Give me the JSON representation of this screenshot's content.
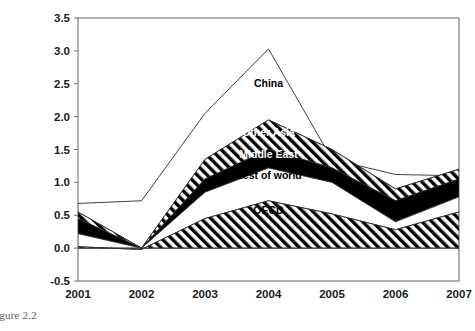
{
  "figure": {
    "caption": "igure 2.2",
    "full_caption_text": "Figure 2.2"
  },
  "chart_data": {
    "type": "area",
    "stacked": true,
    "title": "",
    "xlabel": "",
    "ylabel": "",
    "x": [
      2001,
      2002,
      2003,
      2004,
      2005,
      2006,
      2007
    ],
    "xtick_labels": [
      "2001",
      "2002",
      "2003",
      "2004",
      "2005",
      "2006",
      "2007"
    ],
    "ytick_labels": [
      "-0.5",
      "0.0",
      "0.5",
      "1.0",
      "1.5",
      "2.0",
      "2.5",
      "3.0",
      "3.5"
    ],
    "ytick_values": [
      -0.5,
      0.0,
      0.5,
      1.0,
      1.5,
      2.0,
      2.5,
      3.0,
      3.5
    ],
    "ylim": [
      -0.5,
      3.5
    ],
    "xlim": [
      2001,
      2007
    ],
    "grid": false,
    "legend_position": "inline-annotations",
    "series": [
      {
        "name": "OECD",
        "fill": "diagonal-hatch",
        "values": [
          0.02,
          -0.02,
          0.45,
          0.72,
          0.52,
          0.28,
          0.55
        ],
        "cumulative_top": [
          0.02,
          -0.02,
          0.45,
          0.72,
          0.52,
          0.28,
          0.55
        ]
      },
      {
        "name": "Rest of world",
        "fill": "white",
        "values": [
          0.2,
          0.02,
          0.4,
          0.5,
          0.48,
          0.12,
          0.23
        ],
        "cumulative_top": [
          0.22,
          0.0,
          0.85,
          1.22,
          1.0,
          0.4,
          0.78
        ]
      },
      {
        "name": "Middle East",
        "fill": "black",
        "values": [
          0.23,
          0.0,
          0.2,
          0.28,
          0.22,
          0.32,
          0.27
        ],
        "cumulative_top": [
          0.45,
          0.0,
          1.05,
          1.5,
          1.22,
          0.72,
          1.05
        ]
      },
      {
        "name": "Other Asia",
        "fill": "diagonal-hatch",
        "values": [
          0.1,
          0.0,
          0.3,
          0.45,
          0.28,
          0.18,
          0.15
        ],
        "cumulative_top": [
          0.55,
          0.0,
          1.35,
          1.95,
          1.5,
          0.9,
          1.2
        ]
      },
      {
        "name": "China",
        "fill": "white",
        "values": [
          0.13,
          0.72,
          0.7,
          1.08,
          -0.15,
          0.22,
          -0.1
        ],
        "cumulative_top": [
          0.68,
          0.72,
          2.05,
          3.03,
          1.35,
          1.12,
          1.1
        ]
      }
    ],
    "annotations": [
      {
        "label": "China",
        "x": 2004,
        "y": 2.45,
        "color": "#000000"
      },
      {
        "label": "Other Asia",
        "x": 2004,
        "y": 1.7,
        "color": "#ffffff"
      },
      {
        "label": "Middle East",
        "x": 2004,
        "y": 1.37,
        "color": "#ffffff"
      },
      {
        "label": "Rest of world",
        "x": 2004,
        "y": 1.05,
        "color": "#000000"
      },
      {
        "label": "OECD",
        "x": 2004,
        "y": 0.52,
        "color": "#000000"
      }
    ]
  }
}
